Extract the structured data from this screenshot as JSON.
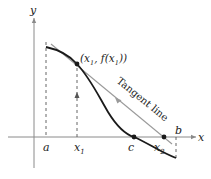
{
  "diagram": {
    "type": "newtons-method-illustration",
    "axes": {
      "x_label": "x",
      "y_label": "y"
    },
    "tick_labels": {
      "a": "a",
      "x1": "x",
      "x1_sub": "1",
      "c": "c",
      "x2": "x",
      "x2_sub": "2",
      "b": "b"
    },
    "point_label": {
      "open": "(x",
      "sub1": "1",
      "mid": ", f(x",
      "sub2": "1",
      "close": "))"
    },
    "tangent_label": "Tangent line",
    "colors": {
      "curve": "#1a1a1a",
      "tangent": "#9a9a9a",
      "axis": "#8a8a8a",
      "dash": "#555555"
    }
  }
}
